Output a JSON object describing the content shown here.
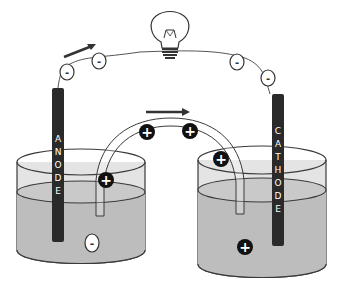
{
  "diagram": {
    "type": "galvanic-cell",
    "anode": {
      "label_letters": [
        "A",
        "N",
        "O",
        "D",
        "E"
      ]
    },
    "cathode": {
      "label_letters": [
        "C",
        "A",
        "T",
        "H",
        "O",
        "D",
        "E"
      ]
    },
    "wire_charges": {
      "symbol": "-",
      "count": 4
    },
    "salt_bridge_charges": {
      "symbol": "+",
      "count": 4
    },
    "anode_solution_ion": "-",
    "cathode_solution_ion": "+",
    "colors": {
      "electrode": "#2a2a2a",
      "solution": "#bdbdbd",
      "beaker_top": "#e6e6e6",
      "outline": "#3a3a3a",
      "ion_fill": "#111111"
    }
  }
}
